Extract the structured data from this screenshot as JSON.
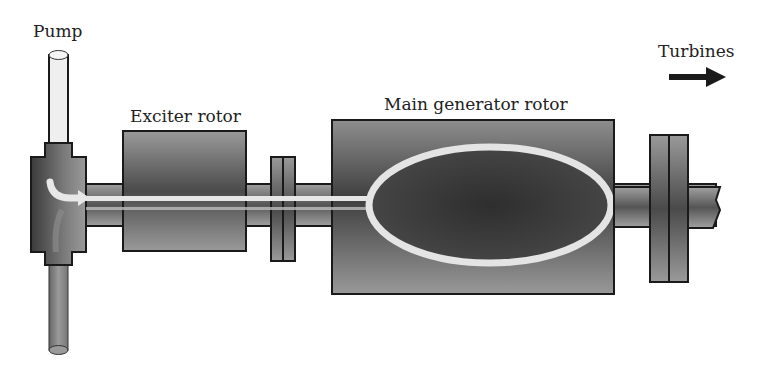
{
  "labels": {
    "pump": "Pump",
    "exciter_rotor": "Exciter rotor",
    "main_generator_rotor": "Main generator rotor",
    "turbines": "Turbines"
  },
  "icons": {
    "flow_arrow": "arrow-right-icon",
    "pump_flow": "curved-arrow-icon"
  },
  "colors": {
    "background": "#ffffff",
    "component_dark": "#4a4a4a",
    "component_mid": "#8a8a8a",
    "cool_pipe": "#ececec",
    "outline": "#1a1a1a",
    "coolant_path": "#e6e6e6"
  }
}
